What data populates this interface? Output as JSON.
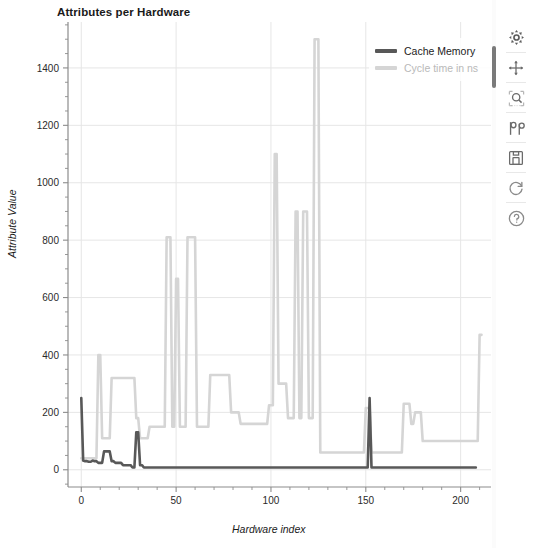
{
  "chart_data": {
    "type": "line",
    "title": "Attributes per Hardware",
    "xlabel": "Hardware index",
    "ylabel": "Attribute Value",
    "xlim": [
      -7,
      216
    ],
    "ylim": [
      -60,
      1560
    ],
    "xticks": [
      0,
      50,
      100,
      150,
      200
    ],
    "yticks": [
      0,
      200,
      400,
      600,
      800,
      1000,
      1200,
      1400
    ],
    "grid": true,
    "legend_position": "upper right",
    "colors": {
      "cache_memory": "#585858",
      "cycle_time": "#d5d5d5",
      "grid": "#e6e6e6",
      "axis": "#8c8c8c",
      "text": "#1a1a1a"
    },
    "series": [
      {
        "name": "Cache Memory",
        "color": "#585858",
        "values": [
          250,
          32,
          30,
          30,
          28,
          28,
          32,
          30,
          30,
          24,
          24,
          24,
          64,
          64,
          64,
          64,
          30,
          30,
          24,
          24,
          24,
          24,
          16,
          16,
          16,
          16,
          16,
          8,
          8,
          131,
          131,
          16,
          16,
          8,
          8,
          8,
          8,
          8,
          8,
          8,
          8,
          8,
          8,
          8,
          8,
          8,
          8,
          8,
          8,
          8,
          8,
          8,
          8,
          8,
          8,
          8,
          8,
          8,
          8,
          8,
          8,
          8,
          8,
          8,
          8,
          8,
          8,
          8,
          8,
          8,
          8,
          8,
          8,
          8,
          8,
          8,
          8,
          8,
          8,
          8,
          8,
          8,
          8,
          8,
          8,
          8,
          8,
          8,
          8,
          8,
          8,
          8,
          8,
          8,
          8,
          8,
          8,
          8,
          8,
          8,
          8,
          8,
          8,
          8,
          8,
          8,
          8,
          8,
          8,
          8,
          8,
          8,
          8,
          8,
          8,
          8,
          8,
          8,
          8,
          8,
          8,
          8,
          8,
          8,
          8,
          8,
          8,
          8,
          8,
          8,
          8,
          8,
          8,
          8,
          8,
          8,
          8,
          8,
          8,
          8,
          8,
          8,
          8,
          8,
          8,
          8,
          8,
          8,
          8,
          8,
          8,
          8,
          250,
          8,
          8,
          8,
          8,
          8,
          8,
          8,
          8,
          8,
          8,
          8,
          8,
          8,
          8,
          8,
          8,
          8,
          8,
          8,
          8,
          8,
          8,
          8,
          8,
          8,
          8,
          8,
          8,
          8,
          8,
          8,
          8,
          8,
          8,
          8,
          8,
          8,
          8,
          8,
          8,
          8,
          8,
          8,
          8,
          8,
          8,
          8,
          8,
          8,
          8,
          8,
          8,
          8,
          8,
          8,
          8
        ]
      },
      {
        "name": "Cycle time in ns",
        "color": "#d5d5d5",
        "values": [
          40,
          40,
          40,
          40,
          40,
          40,
          40,
          40,
          40,
          400,
          400,
          110,
          110,
          110,
          110,
          110,
          320,
          320,
          320,
          320,
          320,
          320,
          320,
          320,
          320,
          320,
          320,
          320,
          320,
          180,
          180,
          110,
          110,
          110,
          110,
          110,
          150,
          150,
          150,
          150,
          150,
          150,
          150,
          150,
          150,
          810,
          810,
          810,
          150,
          150,
          665,
          665,
          150,
          150,
          150,
          150,
          810,
          810,
          810,
          810,
          810,
          150,
          150,
          150,
          150,
          150,
          150,
          150,
          330,
          330,
          330,
          330,
          330,
          330,
          330,
          330,
          330,
          330,
          330,
          200,
          200,
          200,
          200,
          200,
          160,
          160,
          160,
          160,
          160,
          160,
          160,
          160,
          160,
          160,
          160,
          160,
          160,
          160,
          160,
          225,
          225,
          225,
          1100,
          1100,
          300,
          300,
          300,
          300,
          300,
          180,
          180,
          180,
          180,
          900,
          900,
          180,
          180,
          900,
          900,
          900,
          180,
          180,
          180,
          1500,
          1500,
          1500,
          60,
          60,
          60,
          60,
          60,
          60,
          60,
          60,
          60,
          60,
          60,
          60,
          60,
          60,
          60,
          60,
          60,
          60,
          60,
          60,
          60,
          60,
          60,
          60,
          215,
          215,
          215,
          60,
          60,
          60,
          60,
          60,
          60,
          60,
          60,
          60,
          60,
          60,
          60,
          60,
          60,
          60,
          60,
          60,
          230,
          230,
          230,
          230,
          160,
          160,
          200,
          200,
          200,
          200,
          100,
          100,
          100,
          100,
          100,
          100,
          100,
          100,
          100,
          100,
          100,
          100,
          100,
          100,
          100,
          100,
          100,
          100,
          100,
          100,
          100,
          100,
          100,
          100,
          100,
          100,
          100,
          100,
          100,
          100,
          470,
          470
        ]
      }
    ]
  },
  "legend": {
    "items": [
      {
        "label": "Cache Memory",
        "color": "#585858",
        "muted": false
      },
      {
        "label": "Cycle time in ns",
        "color": "#d5d5d5",
        "muted": true
      }
    ]
  },
  "toolbar": {
    "items": [
      {
        "name": "settings-gear-icon",
        "label": "Settings"
      },
      {
        "name": "move-pan-icon",
        "label": "Pan"
      },
      {
        "name": "zoom-rect-icon",
        "label": "Zoom to rectangle"
      },
      {
        "name": "configure-subplots-icon",
        "label": "Configure subplots"
      },
      {
        "name": "save-icon",
        "label": "Save figure"
      },
      {
        "name": "refresh-icon",
        "label": "Reset view"
      },
      {
        "name": "help-icon",
        "label": "Help"
      }
    ]
  }
}
